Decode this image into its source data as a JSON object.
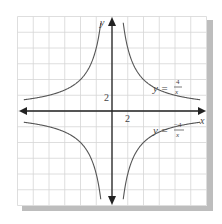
{
  "chart_data": {
    "type": "line",
    "title": "",
    "xlabel": "x",
    "ylabel": "y",
    "xlim": [
      -6,
      6
    ],
    "ylim": [
      -6,
      6
    ],
    "grid": true,
    "grid_step": 1,
    "tick_labels": {
      "x": "2",
      "y": "2"
    },
    "series": [
      {
        "name": "y = 4/x",
        "label_lhs": "y =",
        "numerator": "4",
        "denominator": "x",
        "function": "4/x",
        "color": "#555555"
      },
      {
        "name": "y = -4/x",
        "label_lhs": "y =",
        "numerator": "−4",
        "denominator": "x",
        "function": "-4/x",
        "color": "#555555"
      }
    ],
    "colors": {
      "grid": "#d4d4d4",
      "axis": "#222222",
      "shadow": "#b0b0b0"
    }
  }
}
